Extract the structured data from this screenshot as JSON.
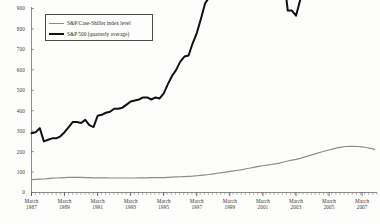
{
  "chart_data": {
    "type": "line",
    "title": "",
    "subtitle": "",
    "xlabel": "",
    "ylabel": "",
    "grid": false,
    "legend_position": "top-left",
    "ylim": [
      0,
      900
    ],
    "y_ticks": [
      0,
      100,
      200,
      300,
      400,
      500,
      600,
      700,
      800,
      900
    ],
    "y_tick_labels": [
      "0",
      "100",
      "200",
      "300",
      "400",
      "500",
      "600",
      "700",
      "800",
      "900"
    ],
    "xlim": [
      "March 1987",
      "March 2008"
    ],
    "x_tick_labels": [
      {
        "month": "March",
        "year": "1987"
      },
      {
        "month": "March",
        "year": "1989"
      },
      {
        "month": "March",
        "year": "1991"
      },
      {
        "month": "March",
        "year": "1993"
      },
      {
        "month": "March",
        "year": "1995"
      },
      {
        "month": "March",
        "year": "1997"
      },
      {
        "month": "March",
        "year": "1999"
      },
      {
        "month": "March",
        "year": "2001"
      },
      {
        "month": "March",
        "year": "2003"
      },
      {
        "month": "March",
        "year": "2005"
      },
      {
        "month": "March",
        "year": "2007"
      }
    ],
    "series": [
      {
        "name": "S&P/Case-Shiller index level",
        "color": "#8c8c8c",
        "width": 1.2,
        "x": [
          1987.2,
          1987.45,
          1987.7,
          1987.95,
          1988.2,
          1988.45,
          1988.7,
          1988.95,
          1989.2,
          1989.45,
          1989.7,
          1989.95,
          1990.2,
          1990.45,
          1990.7,
          1990.95,
          1991.2,
          1991.45,
          1991.7,
          1991.95,
          1992.2,
          1992.45,
          1992.7,
          1992.95,
          1993.2,
          1993.45,
          1993.7,
          1993.95,
          1994.2,
          1994.45,
          1994.7,
          1994.95,
          1995.2,
          1995.45,
          1995.7,
          1995.95,
          1996.2,
          1996.45,
          1996.7,
          1996.95,
          1997.2,
          1997.45,
          1997.7,
          1997.95,
          1998.2,
          1998.45,
          1998.7,
          1998.95,
          1999.2,
          1999.45,
          1999.7,
          1999.95,
          2000.2,
          2000.45,
          2000.7,
          2000.95,
          2001.2,
          2001.45,
          2001.7,
          2001.95,
          2002.2,
          2002.45,
          2002.7,
          2002.95,
          2003.2,
          2003.45,
          2003.7,
          2003.95,
          2004.2,
          2004.45,
          2004.7,
          2004.95,
          2005.2,
          2005.45,
          2005.7,
          2005.95,
          2006.2,
          2006.45,
          2006.7,
          2006.95,
          2007.2,
          2007.45,
          2007.7,
          2007.95
        ],
        "values": [
          63,
          64,
          65,
          66,
          68,
          70,
          71,
          72,
          73,
          74,
          74,
          74,
          74,
          73,
          73,
          72,
          72,
          72,
          72,
          71,
          71,
          71,
          71,
          71,
          71,
          71,
          72,
          72,
          72,
          73,
          73,
          73,
          73,
          74,
          75,
          76,
          77,
          78,
          79,
          80,
          82,
          84,
          86,
          88,
          91,
          94,
          97,
          100,
          103,
          106,
          109,
          112,
          116,
          120,
          124,
          128,
          131,
          134,
          137,
          140,
          144,
          149,
          154,
          158,
          162,
          167,
          173,
          179,
          185,
          191,
          197,
          203,
          208,
          213,
          218,
          222,
          225,
          226,
          226,
          225,
          223,
          220,
          216,
          211
        ]
      },
      {
        "name": "S&P 500 (quarterly average)",
        "color": "#111111",
        "width": 2.0,
        "x": [
          1987.2,
          1987.45,
          1987.7,
          1987.95,
          1988.2,
          1988.45,
          1988.7,
          1988.95,
          1989.2,
          1989.45,
          1989.7,
          1989.95,
          1990.2,
          1990.45,
          1990.7,
          1990.95,
          1991.2,
          1991.45,
          1991.7,
          1991.95,
          1992.2,
          1992.45,
          1992.7,
          1992.95,
          1993.2,
          1993.45,
          1993.7,
          1993.95,
          1994.2,
          1994.45,
          1994.7,
          1994.95,
          1995.2,
          1995.45,
          1995.7,
          1995.95,
          1996.2,
          1996.45,
          1996.7,
          1996.95,
          1997.2,
          1997.45,
          1997.7,
          1997.95,
          1998.2,
          1998.45,
          1998.7,
          1998.95,
          1999.2,
          1999.45,
          1999.7,
          1999.95,
          2000.2,
          2000.45,
          2000.7,
          2000.95,
          2001.2,
          2001.45,
          2001.7,
          2001.95,
          2002.2,
          2002.45,
          2002.7,
          2002.95,
          2003.2,
          2003.45,
          2003.7,
          2003.95,
          2004.2,
          2004.45,
          2004.7,
          2004.95,
          2005.2,
          2005.45,
          2005.7,
          2005.95,
          2006.2,
          2006.45,
          2006.7,
          2006.95,
          2007.2,
          2007.45,
          2007.7,
          2007.95
        ],
        "values": [
          290,
          295,
          315,
          250,
          258,
          265,
          265,
          275,
          295,
          320,
          345,
          345,
          340,
          355,
          330,
          320,
          375,
          380,
          390,
          395,
          410,
          410,
          415,
          430,
          445,
          450,
          455,
          465,
          465,
          455,
          465,
          460,
          485,
          530,
          570,
          600,
          640,
          665,
          670,
          730,
          780,
          850,
          925,
          955,
          1050,
          1110,
          1050,
          1180,
          1270,
          1330,
          1340,
          1400,
          1410,
          1450,
          1500,
          1360,
          1230,
          1230,
          1080,
          1130,
          1130,
          1070,
          890,
          890,
          865,
          940,
          1000,
          1060,
          1120,
          1130,
          1105,
          1160,
          1190,
          1190,
          1225,
          1260,
          1290,
          1280,
          1340,
          1390,
          1420,
          1500,
          1490,
          1380
        ]
      }
    ]
  }
}
